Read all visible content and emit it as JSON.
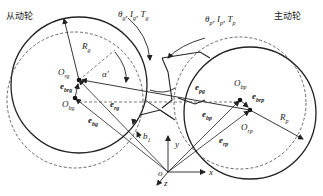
{
  "diagram": {
    "title_left": "从动轮",
    "title_right": "主动轮",
    "driven_gear": {
      "params_label": "θ",
      "params_sub1": "g",
      "params_mid": ", I",
      "params_sub2": "g",
      "params_mid2": ", T",
      "params_sub3": "g",
      "radius_label": "R",
      "radius_sub": "g",
      "center_rotation": "O",
      "center_rotation_sub": "rg",
      "center_bearing": "O",
      "center_bearing_sub": "bg",
      "vec_brg": "e",
      "vec_brg_sub": "brg",
      "vec_rg": "e",
      "vec_rg_sub": "rg",
      "vec_bg": "e",
      "vec_bg_sub": "bg",
      "angle": "α′"
    },
    "driving_gear": {
      "params_label": "θ",
      "params_sub1": "p",
      "params_mid": ", I",
      "params_sub2": "p",
      "params_mid2": ", T",
      "params_sub3": "p",
      "radius_label": "R",
      "radius_sub": "p",
      "center_rotation": "O",
      "center_rotation_sub": "rp",
      "center_bearing": "O",
      "center_bearing_sub": "bp",
      "vec_brp": "e",
      "vec_brp_sub": "brp",
      "vec_rp": "e",
      "vec_rp_sub": "rp",
      "vec_bp": "e",
      "vec_bp_sub": "bp"
    },
    "mesh": {
      "vec_pg": "e",
      "vec_pg_sub": "pg",
      "backlash": "b",
      "backlash_sub": "1"
    },
    "axes": {
      "origin": "o",
      "x": "x",
      "y": "y",
      "z": "z"
    }
  }
}
